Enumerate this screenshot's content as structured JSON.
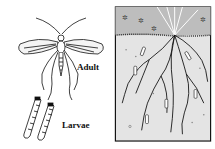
{
  "figure": {
    "labels": {
      "adult": "Adult",
      "larvae": "Larvae"
    },
    "panels": [
      {
        "name": "adult-insect",
        "description": "winged adult gnat"
      },
      {
        "name": "larvae",
        "description": "two larvae"
      },
      {
        "name": "root-soil-scene",
        "description": "larvae feeding on plant roots in soil"
      }
    ],
    "colors": {
      "ink": "#111111",
      "soil": "#e4e4e4",
      "surface": "#bdbdbd",
      "paper": "#ffffff"
    }
  }
}
